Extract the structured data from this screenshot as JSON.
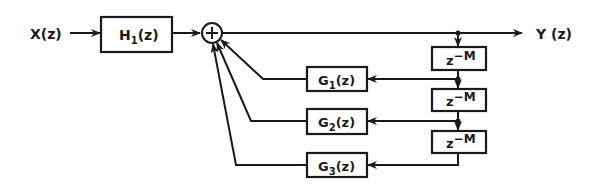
{
  "diagram": {
    "type": "block-diagram",
    "input": {
      "label": "X(z)"
    },
    "output": {
      "label": "Y (z)"
    },
    "prefilter": {
      "name": "H",
      "sub": "1",
      "arg": "(z)"
    },
    "summer": {
      "symbol": "+"
    },
    "delays": [
      {
        "base": "z",
        "exp": "−M"
      },
      {
        "base": "z",
        "exp": "−M"
      },
      {
        "base": "z",
        "exp": "−M"
      }
    ],
    "feedback": [
      {
        "name": "G",
        "sub": "1",
        "arg": "(z)"
      },
      {
        "name": "G",
        "sub": "2",
        "arg": "(z)"
      },
      {
        "name": "G",
        "sub": "3",
        "arg": "(z)"
      }
    ],
    "colors": {
      "ink": "#1a1a1a",
      "background": "#ffffff"
    }
  }
}
